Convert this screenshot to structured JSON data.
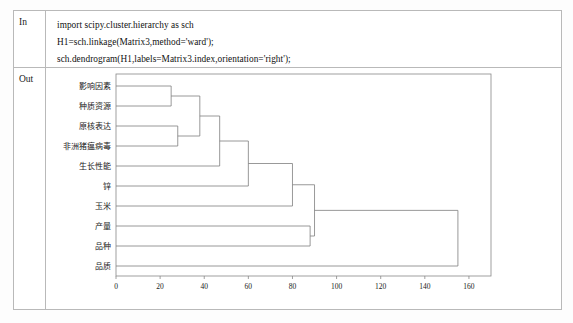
{
  "notebook": {
    "in_label": "In",
    "out_label": "Out",
    "code_lines": [
      "import scipy.cluster.hierarchy as sch",
      "H1=sch.linkage(Matrix3,method='ward');",
      "sch.dendrogram(H1,labels=Matrix3.index,orientation='right');"
    ]
  },
  "chart_data": {
    "type": "dendrogram",
    "title": "",
    "xlabel": "",
    "ylabel": "",
    "orientation": "right",
    "linkage_method": "ward",
    "xlim": [
      0,
      170
    ],
    "xticks": [
      0,
      20,
      40,
      60,
      80,
      100,
      120,
      140,
      160
    ],
    "xtick_labels": [
      "0",
      "20",
      "40",
      "60",
      "80",
      "100",
      "120",
      "140",
      "160"
    ],
    "grid": false,
    "legend": null,
    "line_color": "#7f7f7f",
    "leaf_labels": [
      "影响因素",
      "种质资源",
      "原核表达",
      "非洲猪瘟病毒",
      "生长性能",
      "锌",
      "玉米",
      "产量",
      "品种",
      "品质"
    ],
    "merges": [
      {
        "id": "m1",
        "children": [
          "影响因素",
          "种质资源"
        ],
        "height": 25
      },
      {
        "id": "m2",
        "children": [
          "原核表达",
          "非洲猪瘟病毒"
        ],
        "height": 28
      },
      {
        "id": "m3",
        "children": [
          "m1",
          "m2"
        ],
        "height": 38
      },
      {
        "id": "m4",
        "children": [
          "m3",
          "生长性能"
        ],
        "height": 47
      },
      {
        "id": "m5",
        "children": [
          "m4",
          "锌"
        ],
        "height": 60
      },
      {
        "id": "m6",
        "children": [
          "m5",
          "玉米"
        ],
        "height": 80
      },
      {
        "id": "m7",
        "children": [
          "产量",
          "品种"
        ],
        "height": 88
      },
      {
        "id": "m8",
        "children": [
          "m6",
          "m7"
        ],
        "height": 90
      },
      {
        "id": "m9",
        "children": [
          "m8",
          "品质"
        ],
        "height": 155
      }
    ]
  }
}
